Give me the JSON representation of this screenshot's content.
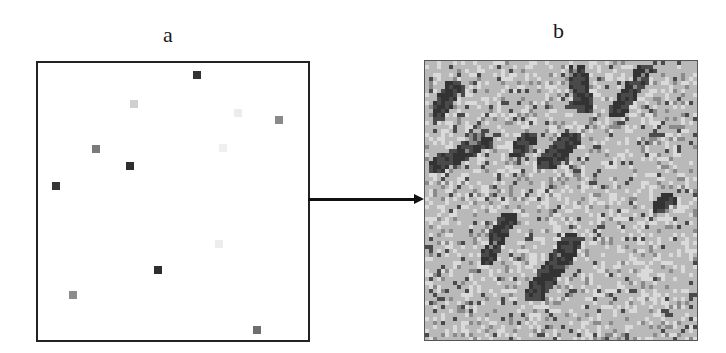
{
  "panels": {
    "a": {
      "label": "a",
      "description": "sparse sample points",
      "points": [
        {
          "x": 197,
          "y": 75,
          "color": "#333333"
        },
        {
          "x": 134,
          "y": 104,
          "color": "#d0d0d0"
        },
        {
          "x": 238,
          "y": 113,
          "color": "#ececec"
        },
        {
          "x": 279,
          "y": 120,
          "color": "#8a8a8a"
        },
        {
          "x": 96,
          "y": 149,
          "color": "#7a7a7a"
        },
        {
          "x": 223,
          "y": 148,
          "color": "#efefef"
        },
        {
          "x": 130,
          "y": 166,
          "color": "#2e2e2e"
        },
        {
          "x": 56,
          "y": 186,
          "color": "#363636"
        },
        {
          "x": 219,
          "y": 244,
          "color": "#ededed"
        },
        {
          "x": 158,
          "y": 270,
          "color": "#2e2e2e"
        },
        {
          "x": 73,
          "y": 295,
          "color": "#8c8c8c"
        },
        {
          "x": 257,
          "y": 330,
          "color": "#6e6e6e"
        }
      ]
    },
    "b": {
      "label": "b",
      "description": "simulated grayscale field",
      "cell_size": 4,
      "palette": {
        "light": "#dadada",
        "base": "#b9b9b9",
        "mid": "#8a8a8a",
        "dark": "#4a4a4a",
        "darker": "#333333"
      },
      "streaks": [
        {
          "x1": 0.55,
          "y1": 0.03,
          "x2": 0.58,
          "y2": 0.16,
          "w": 3
        },
        {
          "x1": 0.8,
          "y1": 0.03,
          "x2": 0.7,
          "y2": 0.17,
          "w": 2
        },
        {
          "x1": 0.1,
          "y1": 0.08,
          "x2": 0.04,
          "y2": 0.18,
          "w": 2
        },
        {
          "x1": 0.22,
          "y1": 0.28,
          "x2": 0.03,
          "y2": 0.37,
          "w": 2
        },
        {
          "x1": 0.38,
          "y1": 0.27,
          "x2": 0.33,
          "y2": 0.32,
          "w": 2
        },
        {
          "x1": 0.53,
          "y1": 0.27,
          "x2": 0.44,
          "y2": 0.36,
          "w": 3
        },
        {
          "x1": 0.3,
          "y1": 0.55,
          "x2": 0.22,
          "y2": 0.7,
          "w": 2
        },
        {
          "x1": 0.54,
          "y1": 0.63,
          "x2": 0.39,
          "y2": 0.83,
          "w": 3
        },
        {
          "x1": 0.9,
          "y1": 0.48,
          "x2": 0.84,
          "y2": 0.52,
          "w": 1
        }
      ]
    }
  },
  "arrow": {
    "from": "a",
    "to": "b"
  }
}
